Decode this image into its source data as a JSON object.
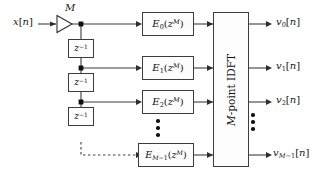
{
  "figure": {
    "type": "block-diagram"
  },
  "input": {
    "label_base": "x",
    "label_index": "n",
    "label_full": "x[n]"
  },
  "downsampler": {
    "factor_label": "M",
    "symbol": "triangle"
  },
  "delays": [
    {
      "id": "z1",
      "base": "z",
      "exponent": "-1",
      "label": "z^-1"
    },
    {
      "id": "z2",
      "base": "z",
      "exponent": "-1",
      "label": "z^-1"
    },
    {
      "id": "z3",
      "base": "z",
      "exponent": "-1",
      "label": "z^-1"
    }
  ],
  "delay_chain_continuation": "dashed",
  "polyphase_filters": [
    {
      "base": "E",
      "sub": "0",
      "arg_base": "z",
      "arg_exp": "M",
      "label": "E_0(z^M)"
    },
    {
      "base": "E",
      "sub": "1",
      "arg_base": "z",
      "arg_exp": "M",
      "label": "E_1(z^M)"
    },
    {
      "base": "E",
      "sub": "2",
      "arg_base": "z",
      "arg_exp": "M",
      "label": "E_2(z^M)"
    },
    {
      "base": "E",
      "sub": "M-1",
      "arg_base": "z",
      "arg_exp": "M",
      "label": "E_M-1(z^M)"
    }
  ],
  "idft_block": {
    "prefix": "M",
    "text": "-point IDFT",
    "label": "M-point IDFT",
    "orientation": "vertical"
  },
  "outputs": [
    {
      "base": "v",
      "sub": "0",
      "index": "n",
      "label": "v_0[n]"
    },
    {
      "base": "v",
      "sub": "1",
      "index": "n",
      "label": "v_1[n]"
    },
    {
      "base": "v",
      "sub": "2",
      "index": "n",
      "label": "v_2[n]"
    },
    {
      "base": "v",
      "sub": "M-1",
      "index": "n",
      "label": "v_M-1[n]"
    }
  ],
  "ellipses": {
    "filters_column": "vertical-dots",
    "outputs_column": "vertical-dots",
    "count": 3
  },
  "colors": {
    "line": "#3c3c3c",
    "text": "#111111",
    "background": "#ffffff",
    "box_fill": "#fdfdfd"
  }
}
